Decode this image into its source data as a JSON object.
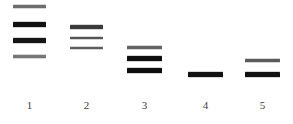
{
  "figure": {
    "type": "gel-electrophoresis",
    "width": 293,
    "height": 124,
    "background_color": "#ffffff",
    "label_color": "#3d3d3d",
    "label_row_y": 100
  },
  "lanes": [
    {
      "label": "1",
      "x": 13,
      "width": 33,
      "bands": [
        {
          "y": 5,
          "height": 3,
          "color": "#6d6d6d"
        },
        {
          "y": 22,
          "height": 5,
          "color": "#121212"
        },
        {
          "y": 38,
          "height": 5,
          "color": "#151515"
        },
        {
          "y": 55,
          "height": 3,
          "color": "#767676"
        }
      ]
    },
    {
      "label": "2",
      "x": 70,
      "width": 33,
      "bands": [
        {
          "y": 25,
          "height": 4,
          "color": "#3a3a3a"
        },
        {
          "y": 37,
          "height": 2,
          "color": "#565656"
        },
        {
          "y": 47,
          "height": 2,
          "color": "#5e5e5e"
        }
      ]
    },
    {
      "label": "3",
      "x": 127,
      "width": 35,
      "bands": [
        {
          "y": 46,
          "height": 3,
          "color": "#636363"
        },
        {
          "y": 56,
          "height": 5,
          "color": "#0e0e0e"
        },
        {
          "y": 68,
          "height": 5,
          "color": "#0e0e0e"
        }
      ]
    },
    {
      "label": "4",
      "x": 188,
      "width": 35,
      "bands": [
        {
          "y": 72,
          "height": 5,
          "color": "#111111"
        }
      ]
    },
    {
      "label": "5",
      "x": 245,
      "width": 35,
      "bands": [
        {
          "y": 59,
          "height": 3,
          "color": "#5b5b5b"
        },
        {
          "y": 72,
          "height": 5,
          "color": "#111111"
        }
      ]
    }
  ],
  "chart_data": {
    "type": "table",
    "title": "",
    "xlabel": "",
    "ylabel": "",
    "categories": [
      "1",
      "2",
      "3",
      "4",
      "5"
    ],
    "series": [
      {
        "name": "band_count",
        "values": [
          4,
          3,
          3,
          1,
          2
        ]
      }
    ],
    "bands_by_lane": {
      "1": [
        {
          "position_y": 6,
          "thickness": 3,
          "intensity": "light"
        },
        {
          "position_y": 24,
          "thickness": 5,
          "intensity": "dark"
        },
        {
          "position_y": 40,
          "thickness": 5,
          "intensity": "dark"
        },
        {
          "position_y": 56,
          "thickness": 3,
          "intensity": "light"
        }
      ],
      "2": [
        {
          "position_y": 27,
          "thickness": 4,
          "intensity": "medium"
        },
        {
          "position_y": 38,
          "thickness": 2,
          "intensity": "light"
        },
        {
          "position_y": 48,
          "thickness": 2,
          "intensity": "light"
        }
      ],
      "3": [
        {
          "position_y": 47,
          "thickness": 3,
          "intensity": "light"
        },
        {
          "position_y": 58,
          "thickness": 5,
          "intensity": "dark"
        },
        {
          "position_y": 70,
          "thickness": 5,
          "intensity": "dark"
        }
      ],
      "4": [
        {
          "position_y": 74,
          "thickness": 5,
          "intensity": "dark"
        }
      ],
      "5": [
        {
          "position_y": 60,
          "thickness": 3,
          "intensity": "medium"
        },
        {
          "position_y": 74,
          "thickness": 5,
          "intensity": "dark"
        }
      ]
    }
  }
}
